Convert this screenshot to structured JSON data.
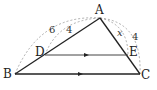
{
  "diagram": {
    "type": "triangle-with-parallel-segment",
    "points": {
      "A": {
        "label": "A",
        "x": 100,
        "y": 18
      },
      "B": {
        "label": "B",
        "x": 15,
        "y": 74
      },
      "C": {
        "label": "C",
        "x": 140,
        "y": 74
      },
      "D": {
        "label": "D",
        "x": 45,
        "y": 55
      },
      "E": {
        "label": "E",
        "x": 128,
        "y": 55
      }
    },
    "segments": [
      "AB",
      "AC",
      "BC",
      "DE"
    ],
    "parallel": [
      "DE",
      "BC"
    ],
    "measures": {
      "AB": "6",
      "AD": "4",
      "AC": "4",
      "AE": "x"
    },
    "colors": {
      "line": "#222222",
      "dashed": "#888888"
    }
  }
}
